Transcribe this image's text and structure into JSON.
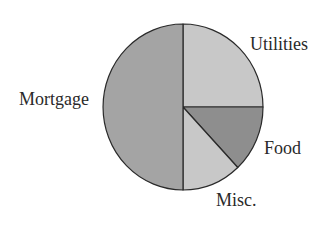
{
  "chart_data": {
    "type": "pie",
    "title": "",
    "categories": [
      "Utilities",
      "Food",
      "Misc.",
      "Mortgage"
    ],
    "values": [
      25,
      13,
      12,
      50
    ],
    "colors": [
      "#c8c8c8",
      "#8e8e8e",
      "#c8c8c8",
      "#a4a4a4"
    ],
    "start_angle_deg": -90,
    "direction": "clockwise",
    "legend": "none",
    "labels_outside": true
  },
  "style": {
    "stroke_color": "#2a2a2a",
    "background": "#ffffff"
  },
  "labels": {
    "utilities": "Utilities",
    "food": "Food",
    "misc": "Misc.",
    "mortgage": "Mortgage"
  }
}
